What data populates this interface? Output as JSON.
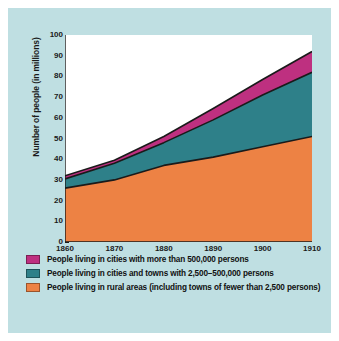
{
  "chart_data": {
    "type": "area",
    "title": "",
    "subtitle": "",
    "xlabel": "",
    "ylabel": "Number of people (in millions)",
    "xlim": [
      1860,
      1910
    ],
    "ylim": [
      0,
      100
    ],
    "grid": false,
    "stacked": true,
    "legend_position": "bottom",
    "x": [
      1860,
      1870,
      1880,
      1890,
      1900,
      1910
    ],
    "x_tick_labels": [
      "1860",
      "1870",
      "1880",
      "1890",
      "1900",
      "1910"
    ],
    "y_ticks": [
      0,
      10,
      20,
      30,
      40,
      50,
      60,
      70,
      80,
      90,
      100
    ],
    "y_tick_labels": [
      "0",
      "10",
      "20",
      "30",
      "40",
      "50",
      "60",
      "70",
      "80",
      "90",
      "100"
    ],
    "series": [
      {
        "name": "People living in rural areas (including towns of fewer than 2,500 persons)",
        "color": "#ed8244",
        "values": [
          26,
          30,
          37,
          41,
          46,
          51
        ]
      },
      {
        "name": "People living in cities and towns with 2,500–500,000 persons",
        "color": "#2e8089",
        "values": [
          4.5,
          8,
          11,
          18,
          25,
          31
        ]
      },
      {
        "name": "People living in cities with more than 500,000 persons",
        "color": "#be3080",
        "values": [
          1.5,
          1.5,
          3,
          5.5,
          7.5,
          10
        ]
      }
    ],
    "cumulative_tops": {
      "rural": [
        26,
        30,
        37,
        41,
        46,
        51
      ],
      "rural_plus_midcities": [
        30.5,
        38,
        48,
        59,
        71,
        82
      ],
      "total": [
        32,
        39.5,
        51,
        64.5,
        78.5,
        92
      ]
    }
  },
  "legend": {
    "items": [
      {
        "color": "#be3080",
        "label": "People living in cities with more than 500,000 persons"
      },
      {
        "color": "#2e8089",
        "label": "People living in cities and towns with 2,500–500,000 persons"
      },
      {
        "color": "#ed8244",
        "label": "People living in rural areas (including towns of fewer than 2,500 persons)"
      }
    ]
  },
  "colors": {
    "background": "#bfdfe2",
    "plot_background": "#ffffff",
    "axis": "#1a1a1a",
    "magenta": "#be3080",
    "teal": "#2e8089",
    "orange": "#ed8244"
  }
}
